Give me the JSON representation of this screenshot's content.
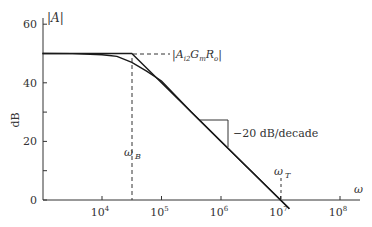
{
  "chart_data": {
    "type": "line",
    "title": "",
    "xlabel": "ω",
    "ylabel": "dB",
    "y_axis_title": "|A|",
    "x_scale": "log",
    "xlim_log10": [
      3.0,
      8.4
    ],
    "ylim": [
      0,
      60
    ],
    "grid": false,
    "legend": null,
    "x_ticks": [
      {
        "exp": 4,
        "label": "10",
        "sup": "4"
      },
      {
        "exp": 5,
        "label": "10",
        "sup": "5"
      },
      {
        "exp": 6,
        "label": "10",
        "sup": "6"
      },
      {
        "exp": 7,
        "label": "10",
        "sup": "7"
      },
      {
        "exp": 8,
        "label": "10",
        "sup": "8"
      }
    ],
    "y_ticks": [
      {
        "value": 0,
        "label": "0"
      },
      {
        "value": 10,
        "label": ""
      },
      {
        "value": 20,
        "label": "20"
      },
      {
        "value": 30,
        "label": ""
      },
      {
        "value": 40,
        "label": "40"
      },
      {
        "value": 50,
        "label": ""
      },
      {
        "value": 60,
        "label": "60"
      }
    ],
    "series": [
      {
        "name": "asymptotic (Bode) magnitude",
        "style": "solid",
        "points_log10w_db": [
          [
            3.0,
            50
          ],
          [
            4.5,
            50
          ],
          [
            7.0,
            0
          ],
          [
            7.15,
            -3
          ]
        ]
      },
      {
        "name": "actual magnitude",
        "style": "solid",
        "points_log10w_db": [
          [
            3.0,
            50
          ],
          [
            3.5,
            49.96
          ],
          [
            4.0,
            49.6
          ],
          [
            4.25,
            49.0
          ],
          [
            4.5,
            47.0
          ],
          [
            4.75,
            44.0
          ],
          [
            5.0,
            40.6
          ],
          [
            5.5,
            30.0
          ],
          [
            6.0,
            20.0
          ],
          [
            7.0,
            0.0
          ],
          [
            7.15,
            -3
          ]
        ]
      }
    ],
    "dc_gain_db": 50,
    "omega_B_log10": 4.5,
    "omega_T_log10": 7.0,
    "annotations": [
      {
        "text": "|A",
        "sub": "i2",
        "text2": "G",
        "sub2": "m",
        "text3": "R",
        "sub3": "o",
        "text4": "|",
        "type": "dashed-horizontal-from-corner",
        "y_db": 50
      },
      {
        "text": "ω",
        "sub": "B",
        "type": "dashed-vertical",
        "x_log10": 4.5
      },
      {
        "text": "ω",
        "sub": "T",
        "type": "dashed-vertical",
        "x_log10": 7.0
      },
      {
        "text": "−20 dB/decade",
        "type": "slope-triangle"
      }
    ],
    "labels": {
      "y_axis_title": "|A|",
      "y_unit": "dB",
      "x_axis_symbol": "ω",
      "gain_label_main": "|A",
      "gain_label_sub1": "i2",
      "gain_label_mid1": "G",
      "gain_label_sub2": "m",
      "gain_label_mid2": "R",
      "gain_label_sub3": "o",
      "gain_label_end": "|",
      "omega_b_main": "ω",
      "omega_b_sub": "B",
      "omega_t_main": "ω",
      "omega_t_sub": "T",
      "slope_label": "−20 dB/decade"
    },
    "colors": {
      "line": "#1a1a1a",
      "axis": "#333333",
      "text": "#333333"
    }
  }
}
